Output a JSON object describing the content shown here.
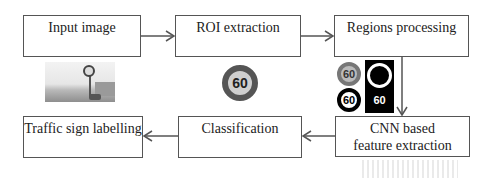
{
  "diagram": {
    "type": "flowchart",
    "nodes": [
      {
        "id": "input_image",
        "label": "Input image"
      },
      {
        "id": "roi_extraction",
        "label": "ROI extraction"
      },
      {
        "id": "regions_processing",
        "label": "Regions processing"
      },
      {
        "id": "cnn_feature_extraction",
        "label_line1": "CNN based",
        "label_line2": "feature extraction"
      },
      {
        "id": "classification",
        "label": "Classification"
      },
      {
        "id": "traffic_sign_labelling",
        "label": "Traffic sign labelling"
      }
    ],
    "edges": [
      {
        "from": "input_image",
        "to": "roi_extraction"
      },
      {
        "from": "roi_extraction",
        "to": "regions_processing"
      },
      {
        "from": "regions_processing",
        "to": "cnn_feature_extraction"
      },
      {
        "from": "cnn_feature_extraction",
        "to": "classification"
      },
      {
        "from": "classification",
        "to": "traffic_sign_labelling"
      }
    ],
    "illustrations": {
      "roi_sign_text": "60",
      "regions_signs": [
        "60",
        "60",
        "60"
      ]
    },
    "colors": {
      "border": "#555555",
      "arrow": "#555555",
      "text": "#222222",
      "background": "#ffffff"
    }
  }
}
